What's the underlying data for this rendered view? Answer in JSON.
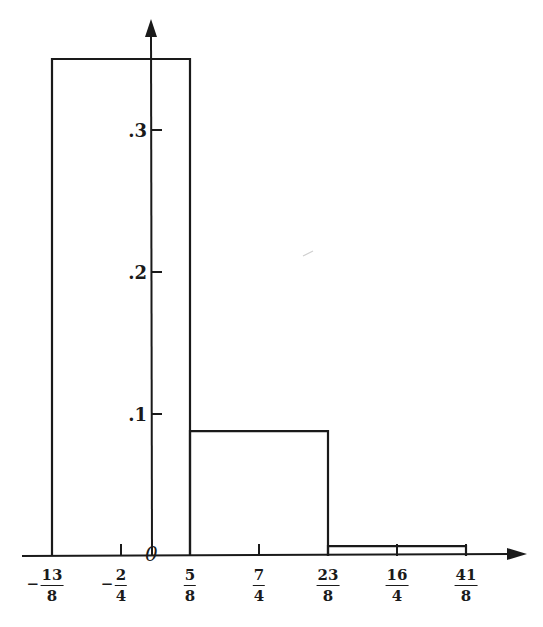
{
  "chart_data": {
    "type": "bar",
    "subtype": "histogram",
    "title": "",
    "xlabel": "",
    "ylabel": "",
    "origin_label": "0",
    "x_ticks": [
      {
        "label": "-13/8",
        "sign": "−",
        "num": "13",
        "den": "8",
        "value": -1.625
      },
      {
        "label": "-2/4",
        "sign": "−",
        "num": "2",
        "den": "4",
        "value": -0.5
      },
      {
        "label": "5/8",
        "sign": "",
        "num": "5",
        "den": "8",
        "value": 0.625
      },
      {
        "label": "7/4",
        "sign": "",
        "num": "7",
        "den": "4",
        "value": 1.75
      },
      {
        "label": "23/8",
        "sign": "",
        "num": "23",
        "den": "8",
        "value": 2.875
      },
      {
        "label": "16/4",
        "sign": "",
        "num": "16",
        "den": "4",
        "value": 4.0
      },
      {
        "label": "41/8",
        "sign": "",
        "num": "41",
        "den": "8",
        "value": 5.125
      }
    ],
    "y_ticks": [
      {
        "label": ".1",
        "value": 0.1
      },
      {
        "label": ".2",
        "value": 0.2
      },
      {
        "label": ".3",
        "value": 0.3
      }
    ],
    "bins": [
      {
        "from": -1.625,
        "to": 0.625,
        "height": 0.35
      },
      {
        "from": 0.625,
        "to": 2.875,
        "height": 0.088
      },
      {
        "from": 2.875,
        "to": 5.125,
        "height": 0.007
      }
    ],
    "ylim": [
      0,
      0.38
    ],
    "grid": false,
    "legend": null
  }
}
